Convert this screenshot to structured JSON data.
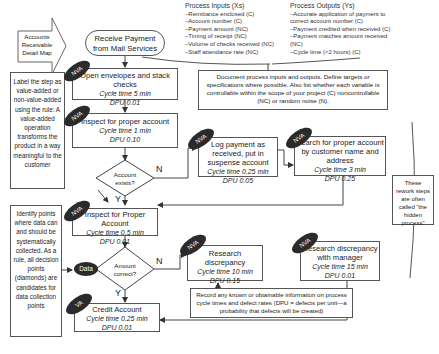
{
  "title_arrow": {
    "label": "Accounts Receivable Detail Map"
  },
  "start": {
    "label": "Receive Payment from Mail Services"
  },
  "process_inputs": {
    "title": "Process Inputs (Xs)",
    "items": [
      "–Remittance enclosed (C)",
      "–Account number (C)",
      "–Payment amount (NC)",
      "–Timing of receipt (NC)",
      "–Volume of checks received (NC)",
      "–Staff attendance rate (NC)"
    ]
  },
  "process_outputs": {
    "title": "Process Outputs (Ys)",
    "items": [
      "–Accurate application of payment to correct account number (C)",
      "–Payment credited when received (C)",
      "–Payment matches amount received (NC)",
      "–Cycle time (<2 hours) (C)"
    ]
  },
  "notes": {
    "document": "Document process inputs and outputs. Define targets or specifications where possible. Also list whether each variable is controllable within the scope of your project (C) noncontrollable (NC) or random noise (N).",
    "label_step": "Label the step as value-added or non-value-added using the rule: A value-added operation transforms the product in a way meaningful to the customer",
    "identify": "Identify points where data can and should be systematically collected. As a rule, all decision points (diamonds) are candidates for data collection points",
    "hidden": "These rework steps are often called \"the hidden process\"",
    "record": "Record any known or obtainable information on process cycle times and defect rates (DPU = defects per unit—a probability that defects will be created)"
  },
  "steps": [
    {
      "id": "open",
      "title": "Open envelopes and stack checks",
      "cycle": "Cycle time  5 min",
      "dpu": "DPU  0.01",
      "tag": "NVA"
    },
    {
      "id": "inspect1",
      "title": "Inspect for proper account",
      "cycle": "Cycle time  1 min",
      "dpu": "DPU  0.10",
      "tag": "NVA"
    },
    {
      "id": "log",
      "title": "Log payment as received, put in suspense account",
      "cycle": "Cycle time  0.25 min",
      "dpu": "DPU  0.05",
      "tag": "NVA"
    },
    {
      "id": "search",
      "title": "Search for proper account by customer name and address",
      "cycle": "Cycle time  3 min",
      "dpu": "DPU  0.25",
      "tag": "NVA"
    },
    {
      "id": "inspect2",
      "title": "Inspect for Proper Account",
      "cycle": "Cycle time  0.5 min",
      "dpu": "DPU  0.01",
      "tag": "NVA"
    },
    {
      "id": "research",
      "title": "Research discrepancy",
      "cycle": "Cycle time  10 min",
      "dpu": "DPU 0.15",
      "tag": "NVA"
    },
    {
      "id": "manager",
      "title": "Research discrepancy with manager",
      "cycle": "Cycle time  15 min",
      "dpu": "DPU  0.01",
      "tag": "NVA"
    },
    {
      "id": "credit",
      "title": "Credit Account",
      "cycle": "Cycle time  0.25 min",
      "dpu": "DPU  0.01",
      "tag": "VA"
    }
  ],
  "decisions": [
    {
      "id": "exists",
      "label": "Account exists?",
      "yes": "Y",
      "no": "N"
    },
    {
      "id": "amount",
      "label": "Amount correct?",
      "yes": "Y",
      "no": "N"
    }
  ],
  "data_tag": {
    "label": "Data"
  },
  "colors": {
    "line": "#444444",
    "tag_fill": "#2b2b2b",
    "tag_text": "#ffffff",
    "box_border": "#555555"
  }
}
